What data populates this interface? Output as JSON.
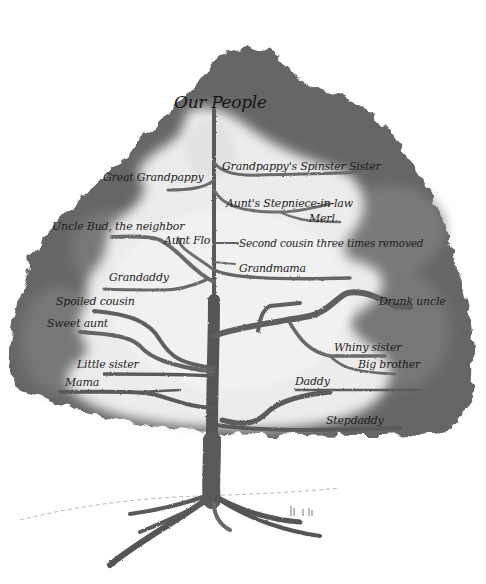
{
  "illustration": {
    "title": "Our People",
    "colors": {
      "foliage_dark": "#5e5e5e",
      "foliage_mid": "#8a8a8a",
      "foliage_light": "#e8e8e8",
      "trunk": "#555555",
      "text": "#1e1e1e",
      "background": "#ffffff"
    },
    "labels": [
      {
        "id": "great-grandpappy",
        "text": "Great Grandpappy",
        "x": 103,
        "y": 172
      },
      {
        "id": "grandpappys-spinster-sister",
        "text": "Grandpappy's Spinster Sister",
        "x": 222,
        "y": 162
      },
      {
        "id": "aunts-stepniece-in-law",
        "text": "Aunt's Stepniece-in-law",
        "x": 226,
        "y": 199
      },
      {
        "id": "merl",
        "text": "Merl",
        "x": 309,
        "y": 214
      },
      {
        "id": "uncle-bud-the-neighbor",
        "text": "Uncle Bud, the neighbor",
        "x": 52,
        "y": 222
      },
      {
        "id": "aunt-flo",
        "text": "Aunt Flo",
        "x": 164,
        "y": 236
      },
      {
        "id": "second-cousin-three-times-removed",
        "text": "Second cousin three times removed",
        "x": 239,
        "y": 239
      },
      {
        "id": "grandmama",
        "text": "Grandmama",
        "x": 239,
        "y": 264
      },
      {
        "id": "grandaddy",
        "text": "Grandaddy",
        "x": 109,
        "y": 273
      },
      {
        "id": "spoiled-cousin",
        "text": "Spoiled cousin",
        "x": 56,
        "y": 297
      },
      {
        "id": "drunk-uncle",
        "text": "Drunk uncle",
        "x": 379,
        "y": 297
      },
      {
        "id": "sweet-aunt",
        "text": "Sweet aunt",
        "x": 47,
        "y": 319
      },
      {
        "id": "whiny-sister",
        "text": "Whiny sister",
        "x": 334,
        "y": 343
      },
      {
        "id": "little-sister",
        "text": "Little sister",
        "x": 77,
        "y": 360
      },
      {
        "id": "big-brother",
        "text": "Big brother",
        "x": 358,
        "y": 360
      },
      {
        "id": "mama",
        "text": "Mama",
        "x": 65,
        "y": 378
      },
      {
        "id": "daddy",
        "text": "Daddy",
        "x": 295,
        "y": 377
      },
      {
        "id": "stepdaddy",
        "text": "Stepdaddy",
        "x": 326,
        "y": 416
      }
    ]
  }
}
